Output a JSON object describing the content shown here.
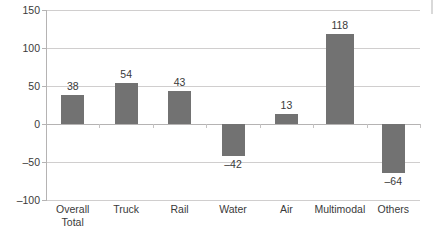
{
  "chart_data": {
    "type": "bar",
    "title": "",
    "subtitle": "",
    "xlabel": "",
    "ylabel": "",
    "categories": [
      "Overall Total",
      "Truck",
      "Rail",
      "Water",
      "Air",
      "Multimodal",
      "Others"
    ],
    "category_lines": [
      [
        "Overall",
        "Total"
      ],
      [
        "Truck"
      ],
      [
        "Rail"
      ],
      [
        "Water"
      ],
      [
        "Air"
      ],
      [
        "Multimodal"
      ],
      [
        "Others"
      ]
    ],
    "values": [
      38,
      54,
      43,
      -42,
      13,
      118,
      -64
    ],
    "value_labels": [
      "38",
      "54",
      "43",
      "–42",
      "13",
      "118",
      "–64"
    ],
    "ylim": [
      -100,
      150
    ],
    "yticks": [
      150,
      100,
      50,
      0,
      -50,
      -100
    ],
    "ytick_labels": [
      "150",
      "100",
      "50",
      "0",
      "–50",
      "–100"
    ],
    "grid": true,
    "legend": false,
    "legend_position": "none",
    "series": [
      {
        "name": "",
        "values": [
          38,
          54,
          43,
          -42,
          13,
          118,
          -64
        ]
      }
    ],
    "colors": {
      "bar": "#727272",
      "gridline": "#d0cece",
      "axis": "#b5b3b3",
      "text": "#3a3a3a",
      "background": "#ffffff"
    }
  }
}
